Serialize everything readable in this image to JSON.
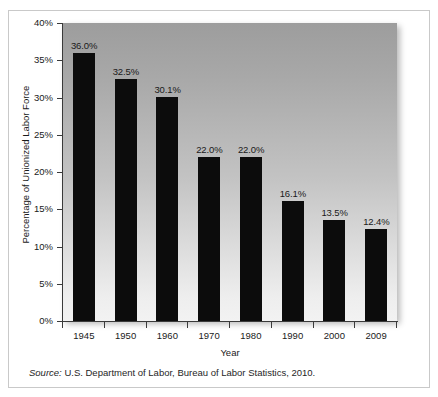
{
  "chart_data": {
    "type": "bar",
    "title": "",
    "subtitle": "",
    "categories": [
      "1945",
      "1950",
      "1960",
      "1970",
      "1980",
      "1990",
      "2000",
      "2009"
    ],
    "values": [
      36.0,
      32.5,
      30.1,
      22.0,
      22.0,
      16.1,
      13.5,
      12.4
    ],
    "data_labels": [
      "36.0%",
      "32.5%",
      "30.1%",
      "22.0%",
      "22.0%",
      "16.1%",
      "13.5%",
      "12.4%"
    ],
    "xlabel": "Year",
    "ylabel": "Percentage of Unionized Labor Force",
    "ylim": [
      0,
      40
    ],
    "ytick_values": [
      0,
      5,
      10,
      15,
      20,
      25,
      30,
      35,
      40
    ],
    "ytick_labels": [
      "0%",
      "5%",
      "10%",
      "15%",
      "20%",
      "25%",
      "30%",
      "35%",
      "40%"
    ],
    "grid": false,
    "legend": false,
    "legend_position": "none",
    "bar_color": "#0c0c0c",
    "plot_background": "gradient-gray-top-to-light-bottom",
    "annotations": []
  },
  "figure": {
    "source_prefix": "Source:",
    "source_text": " U.S. Department of Labor, Bureau of Labor Statistics, 2010."
  }
}
